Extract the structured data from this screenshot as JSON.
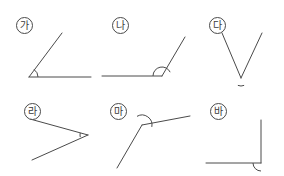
{
  "page": {
    "background_color": "#ffffff",
    "stroke_color": "#4a4a4a",
    "width": 284,
    "height": 176
  },
  "figures": [
    {
      "id": "ga",
      "label": "가",
      "label_x": 16,
      "label_y": 17,
      "angle_kind": "acute",
      "vertex": {
        "x": 29,
        "y": 77
      },
      "rays": [
        {
          "to_x": 91,
          "to_y": 77
        },
        {
          "to_x": 62,
          "to_y": 33
        }
      ],
      "arc_radius": 9,
      "arc_start_deg": 0,
      "arc_end_deg": 56
    },
    {
      "id": "na",
      "label": "나",
      "label_x": 112,
      "label_y": 17,
      "angle_kind": "obtuse",
      "vertex": {
        "x": 162,
        "y": 76
      },
      "rays": [
        {
          "to_x": 102,
          "to_y": 76
        },
        {
          "to_x": 185,
          "to_y": 37
        }
      ],
      "arc_radius": 9,
      "arc_start_deg": 180,
      "arc_end_deg": 25
    },
    {
      "id": "da",
      "label": "다",
      "label_x": 209,
      "label_y": 17,
      "angle_kind": "acute",
      "vertex": {
        "x": 241,
        "y": 78
      },
      "rays": [
        {
          "to_x": 222,
          "to_y": 33
        },
        {
          "to_x": 262,
          "to_y": 33
        }
      ],
      "arc_radius": 8,
      "arc_start_deg": 293,
      "arc_end_deg": 247
    },
    {
      "id": "ra",
      "label": "라",
      "label_x": 24,
      "label_y": 103,
      "angle_kind": "acute",
      "vertex": {
        "x": 88,
        "y": 135
      },
      "rays": [
        {
          "to_x": 30,
          "to_y": 119
        },
        {
          "to_x": 32,
          "to_y": 160
        }
      ],
      "arc_radius": 8,
      "arc_start_deg": 195,
      "arc_end_deg": 165
    },
    {
      "id": "ma",
      "label": "마",
      "label_x": 110,
      "label_y": 103,
      "angle_kind": "obtuse",
      "vertex": {
        "x": 142,
        "y": 125
      },
      "rays": [
        {
          "to_x": 117,
          "to_y": 168
        },
        {
          "to_x": 190,
          "to_y": 116
        }
      ],
      "arc_radius": 10,
      "arc_start_deg": 120,
      "arc_end_deg": 349
    },
    {
      "id": "ba",
      "label": "바",
      "label_x": 210,
      "label_y": 103,
      "angle_kind": "right",
      "vertex": {
        "x": 261,
        "y": 163
      },
      "rays": [
        {
          "to_x": 206,
          "to_y": 163
        },
        {
          "to_x": 261,
          "to_y": 120
        }
      ],
      "arc_radius": 8,
      "arc_start_deg": 180,
      "arc_end_deg": 270
    }
  ]
}
